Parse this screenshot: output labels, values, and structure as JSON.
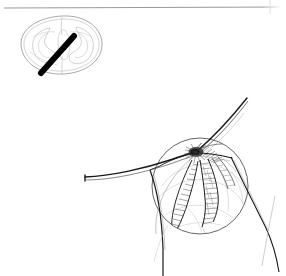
{
  "figure": {
    "medium": "pen-and-ink line illustration",
    "background_color": "#ffffff",
    "ink_color": "#1a1a1a",
    "width_px": 286,
    "height_px": 276,
    "labels": [],
    "caption": "",
    "visible_text_present": false
  },
  "rules": {
    "top_rule": {
      "name": "top-horizontal-rule",
      "x1": 4,
      "y1": 8,
      "x2": 282,
      "y2": 7,
      "color": "#8d8d8d",
      "width": 0.8
    },
    "right_margin_rule": {
      "name": "right-margin-line",
      "x1": 270,
      "y1": 0,
      "x2": 270,
      "y2": 14,
      "color": "#cfcfcf",
      "width": 0.7
    }
  },
  "inset": {
    "name": "orientation-inset",
    "description": "small ovoid cross-section key with internal curved lobes and a solid plane-of-section bar",
    "center_x": 62,
    "center_y": 45,
    "outer_rx": 42,
    "outer_ry": 30,
    "outline_color": "#9a9a9a",
    "inner_color": "#b4b4b4",
    "bar": {
      "name": "section-plane-bar",
      "x1": 41,
      "y1": 73,
      "x2": 74,
      "y2": 36,
      "thickness": 6,
      "color": "#080808"
    }
  },
  "main": {
    "name": "main-drawing",
    "magnifier_circle": {
      "name": "magnification-circle",
      "center_x": 200,
      "center_y": 186,
      "radius": 48,
      "stroke_color": "#6a6a6a",
      "stroke_width": 0.9
    },
    "nexus": {
      "name": "convergence-nexus",
      "x": 196,
      "y": 152,
      "description": "dense dark convergence point where the spike, sweeping curves and hatched fascicles meet"
    },
    "spike": {
      "name": "upper-right-spike",
      "from_x": 196,
      "from_y": 152,
      "to_x": 248,
      "to_y": 97,
      "description": "long tapering needle-like stroke rising to upper right"
    },
    "secondary_spike": {
      "name": "secondary-spike",
      "from_x": 196,
      "from_y": 152,
      "to_x": 231,
      "to_y": 156
    },
    "left_sweep": {
      "name": "left-sweeping-curve",
      "start_x": 85,
      "start_y": 177,
      "end_x": 196,
      "end_y": 152,
      "description": "long blunt-ended curve sweeping in from the left"
    },
    "lower_branch": {
      "name": "lower-branch-curve",
      "start_x": 150,
      "start_y": 170,
      "end_x": 163,
      "end_y": 276
    },
    "right_sweep": {
      "name": "right-sweeping-curve",
      "start_x": 232,
      "start_y": 158,
      "end_x": 278,
      "end_y": 272
    },
    "faint_diagonal": {
      "name": "faint-lower-right-diagonal",
      "start_x": 275,
      "start_y": 196,
      "end_x": 262,
      "end_y": 266,
      "color": "#b0b0b0"
    },
    "fascicles": {
      "name": "hatched-fascicle-group",
      "count": 3,
      "description": "elongated leaf-shaped hatched structures descending from the nexus into the circle"
    }
  }
}
